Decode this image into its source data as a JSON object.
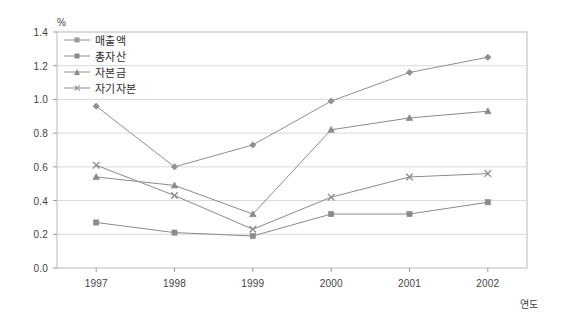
{
  "chart_data": {
    "type": "line",
    "title": "",
    "subtitle": "",
    "unit_label": "%",
    "xlabel": "연도",
    "ylabel": "",
    "categories": [
      "1997",
      "1998",
      "1999",
      "2000",
      "2001",
      "2002"
    ],
    "x": [
      1997,
      1998,
      1999,
      2000,
      2001,
      2002
    ],
    "ylim": [
      0.0,
      1.4
    ],
    "ytick_labels": [
      "0.0",
      "0.2",
      "0.4",
      "0.6",
      "0.8",
      "1.0",
      "1.2",
      "1.4"
    ],
    "ytick_values": [
      0.0,
      0.2,
      0.4,
      0.6,
      0.8,
      1.0,
      1.2,
      1.4
    ],
    "grid": "horizontal",
    "legend_position": "top-left-inside",
    "series": [
      {
        "name": "매출액",
        "marker": "diamond",
        "color": "#8f8f8f",
        "values": [
          0.96,
          0.6,
          0.73,
          0.99,
          1.16,
          1.25
        ]
      },
      {
        "name": "총자산",
        "marker": "square",
        "color": "#8a8a8a",
        "values": [
          0.27,
          0.21,
          0.19,
          0.32,
          0.32,
          0.39
        ]
      },
      {
        "name": "자본금",
        "marker": "triangle",
        "color": "#8a8a8a",
        "values": [
          0.54,
          0.49,
          0.32,
          0.82,
          0.89,
          0.93
        ]
      },
      {
        "name": "자기자본",
        "marker": "x",
        "color": "#8a8a8a",
        "values": [
          0.61,
          0.43,
          0.23,
          0.42,
          0.54,
          0.56
        ]
      }
    ]
  },
  "legend": {
    "items": [
      {
        "label": "매출액"
      },
      {
        "label": "총자산"
      },
      {
        "label": "자본금"
      },
      {
        "label": "자기자본"
      }
    ]
  },
  "axes": {
    "unit": "%",
    "x_axis_title": "연도"
  }
}
